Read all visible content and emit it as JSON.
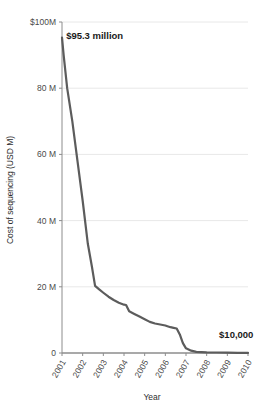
{
  "chart_data": {
    "type": "line",
    "title": "",
    "subtitle": "",
    "xlabel": "Year",
    "ylabel": "Cost of sequencing (USD M)",
    "xlim": [
      2001,
      2010
    ],
    "ylim": [
      0,
      100
    ],
    "grid": true,
    "legend": "none",
    "line_color": "#5c5c5c",
    "gridline_color": "#e8e8e8",
    "axis_color": "#8c8c8c",
    "text_color": "#3c3c3c",
    "background": "#ffffff",
    "y_ticks": [
      {
        "value": 100,
        "label": "$100M"
      },
      {
        "value": 80,
        "label": "80 M"
      },
      {
        "value": 60,
        "label": "60 M"
      },
      {
        "value": 40,
        "label": "40 M"
      },
      {
        "value": 20,
        "label": "20 M"
      },
      {
        "value": 0,
        "label": "0"
      }
    ],
    "x_ticks": [
      {
        "value": 2001,
        "label": "2001"
      },
      {
        "value": 2002,
        "label": "2002"
      },
      {
        "value": 2003,
        "label": "2003"
      },
      {
        "value": 2004,
        "label": "2004"
      },
      {
        "value": 2005,
        "label": "2005"
      },
      {
        "value": 2006,
        "label": "2006"
      },
      {
        "value": 2007,
        "label": "2007"
      },
      {
        "value": 2008,
        "label": "2008"
      },
      {
        "value": 2009,
        "label": "2009"
      },
      {
        "value": 2010,
        "label": "2010"
      }
    ],
    "series": [
      {
        "name": "Cost of sequencing a human genome",
        "x": [
          2001.0,
          2001.08,
          2001.25,
          2001.5,
          2001.75,
          2002.0,
          2002.25,
          2002.45,
          2002.6,
          2002.8,
          2003.0,
          2003.25,
          2003.5,
          2003.75,
          2004.0,
          2004.1,
          2004.25,
          2004.5,
          2004.75,
          2005.0,
          2005.25,
          2005.5,
          2005.75,
          2006.0,
          2006.1,
          2006.25,
          2006.4,
          2006.55,
          2006.7,
          2006.85,
          2007.0,
          2007.25,
          2007.5,
          2008.0,
          2008.5,
          2009.0,
          2009.5,
          2010.0
        ],
        "y": [
          95.3,
          90.0,
          80.0,
          70.0,
          58.0,
          46.0,
          33.0,
          26.0,
          20.3,
          19.2,
          18.2,
          17.0,
          16.0,
          15.2,
          14.6,
          14.5,
          12.6,
          11.8,
          11.0,
          10.2,
          9.4,
          8.9,
          8.6,
          8.3,
          8.1,
          7.8,
          7.6,
          7.4,
          5.6,
          3.0,
          1.4,
          0.7,
          0.35,
          0.2,
          0.15,
          0.1,
          0.05,
          0.01
        ]
      }
    ],
    "annotations": [
      {
        "name": "start-value",
        "text": "$95.3 million",
        "x": 2001.2,
        "y": 95.0
      },
      {
        "name": "end-value",
        "text": "$10,000",
        "x": 2008.6,
        "y": 4.5
      }
    ]
  }
}
